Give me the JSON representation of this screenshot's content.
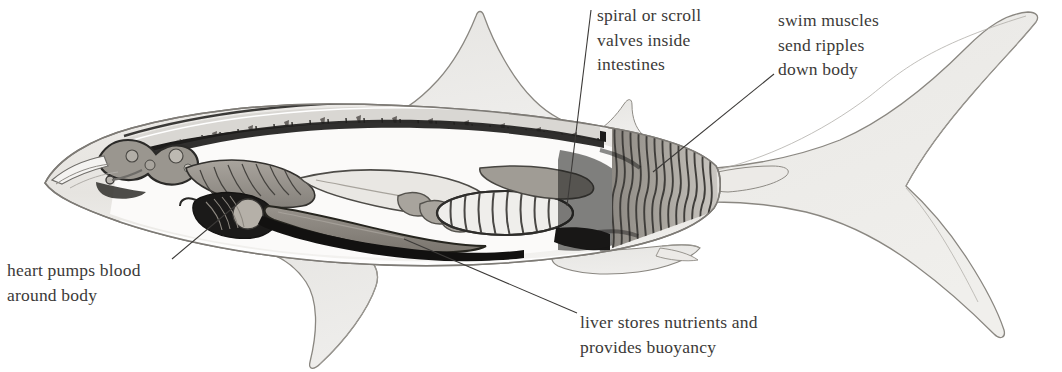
{
  "figure": {
    "view": "lateral cutaway, head at left, tail at right",
    "background_color": "#ffffff",
    "ink_color": "#3c3a38",
    "style": "grayscale pen-and-wash scientific illustration"
  },
  "callouts": [
    {
      "id": "spiral-valve",
      "text": "spiral or scroll\nvalves inside\nintestines",
      "lines": [
        "spiral or scroll",
        "valves inside",
        "intestines"
      ],
      "text_x": 597,
      "text_y": 3,
      "leader": {
        "x1": 591,
        "y1": 10,
        "x2": 567,
        "y2": 206
      }
    },
    {
      "id": "swim-muscles",
      "text": "swim muscles\nsend ripples\ndown body",
      "lines": [
        "swim muscles",
        "send ripples",
        "down body"
      ],
      "text_x": 778,
      "text_y": 8,
      "leader": {
        "x1": 774,
        "y1": 74,
        "x2": 653,
        "y2": 172
      }
    },
    {
      "id": "heart",
      "text": "heart pumps blood\naround body",
      "lines": [
        "heart pumps blood",
        "around body"
      ],
      "text_x": 7,
      "text_y": 258,
      "leader": {
        "x1": 172,
        "y1": 259,
        "x2": 241,
        "y2": 201
      }
    },
    {
      "id": "liver",
      "text": "liver stores nutrients and\nprovides buoyancy",
      "lines": [
        "liver stores nutrients and",
        "provides buoyancy"
      ],
      "text_x": 580,
      "text_y": 310,
      "leader": {
        "x1": 404,
        "y1": 239,
        "x2": 577,
        "y2": 313
      }
    }
  ],
  "anatomy_parts": [
    {
      "name": "snout",
      "tone": "#f2f1ef"
    },
    {
      "name": "brain",
      "tone": "#9a968f"
    },
    {
      "name": "gill-arches",
      "tone": "#8f8b85"
    },
    {
      "name": "heart",
      "tone": "#b4afa7"
    },
    {
      "name": "liver",
      "tone": "#8b867f"
    },
    {
      "name": "spiral-valve-intestine",
      "tone": "#e8e6e2"
    },
    {
      "name": "vertebral-column",
      "tone": "#d8d6d2"
    },
    {
      "name": "swim-muscle-myomeres",
      "tone": "#9e9a94"
    },
    {
      "name": "body-outline",
      "tone": "#e9e8e5"
    },
    {
      "name": "dorsal-fin",
      "tone": "#e4e3e0"
    },
    {
      "name": "pectoral-fin",
      "tone": "#e4e3e0"
    },
    {
      "name": "pelvic-fin",
      "tone": "#e4e3e0"
    },
    {
      "name": "caudal-fin",
      "tone": "#e7e6e3"
    }
  ]
}
